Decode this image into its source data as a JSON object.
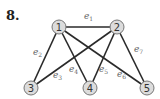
{
  "problem": {
    "number": "8."
  },
  "graph": {
    "nodes": [
      {
        "id": "1",
        "label": "1",
        "x": 59,
        "y": 27
      },
      {
        "id": "2",
        "label": "2",
        "x": 117,
        "y": 27
      },
      {
        "id": "3",
        "label": "3",
        "x": 31,
        "y": 88
      },
      {
        "id": "4",
        "label": "4",
        "x": 90,
        "y": 88
      },
      {
        "id": "5",
        "label": "5",
        "x": 147,
        "y": 88
      }
    ],
    "edges": [
      {
        "id": "e1",
        "base": "e",
        "sub": "1",
        "from": "1",
        "to": "2"
      },
      {
        "id": "e2",
        "base": "e",
        "sub": "2",
        "from": "1",
        "to": "3"
      },
      {
        "id": "e3",
        "base": "e",
        "sub": "3",
        "from": "2",
        "to": "3"
      },
      {
        "id": "e4",
        "base": "e",
        "sub": "4",
        "from": "1",
        "to": "4"
      },
      {
        "id": "e5",
        "base": "e",
        "sub": "5",
        "from": "2",
        "to": "4"
      },
      {
        "id": "e6",
        "base": "e",
        "sub": "6",
        "from": "1",
        "to": "5"
      },
      {
        "id": "e7",
        "base": "e",
        "sub": "7",
        "from": "2",
        "to": "5"
      }
    ]
  }
}
